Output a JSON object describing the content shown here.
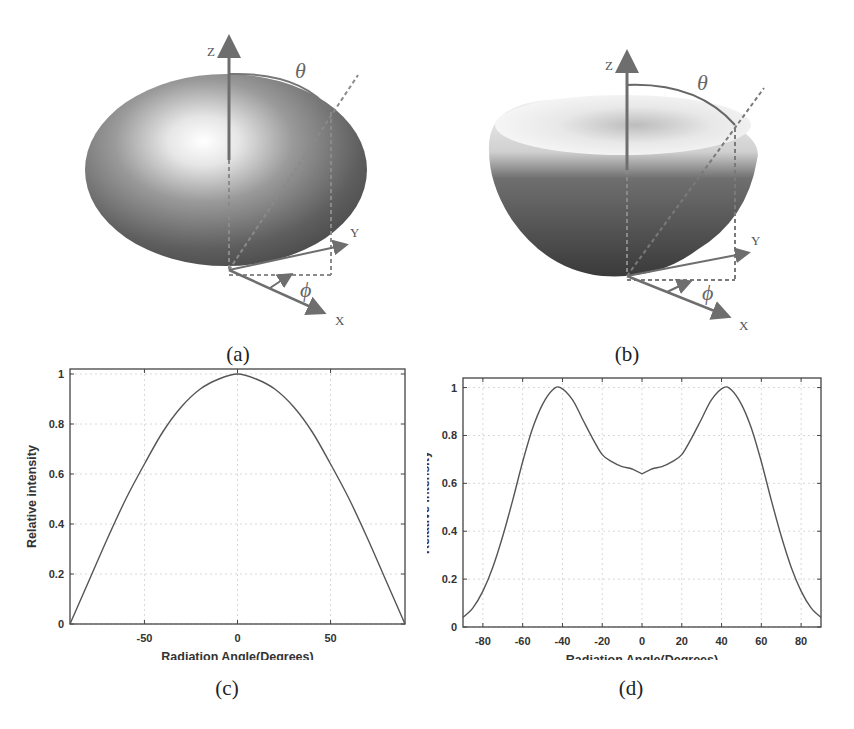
{
  "figure": {
    "panels": [
      {
        "id": "a",
        "caption": "(a)",
        "type": "3d-radiation-pattern",
        "shape": "oblate ellipsoid (Lambertian-like)",
        "axes": {
          "z": "Z",
          "y": "Y",
          "x": "X",
          "theta": "θ",
          "phi": "ϕ"
        }
      },
      {
        "id": "b",
        "caption": "(b)",
        "type": "3d-radiation-pattern",
        "shape": "bowl with central dip (batwing)",
        "axes": {
          "z": "Z",
          "y": "Y",
          "x": "X",
          "theta": "θ",
          "phi": "ϕ"
        }
      },
      {
        "id": "c",
        "caption": "(c)"
      },
      {
        "id": "d",
        "caption": "(d)"
      }
    ]
  },
  "chart_data": [
    {
      "panel": "c",
      "type": "line",
      "title": "",
      "xlabel": "Radiation Angle(Degrees)",
      "ylabel": "Relative intensity",
      "xlim": [
        -90,
        90
      ],
      "ylim": [
        0,
        1.02
      ],
      "xticks": [
        -50,
        0,
        50
      ],
      "xtick_labels": [
        "-50",
        "0",
        "50"
      ],
      "yticks": [
        0,
        0.2,
        0.4,
        0.6,
        0.8,
        1
      ],
      "ytick_labels": [
        "0",
        "0.2",
        "0.4",
        "0.6",
        "0.8",
        "1"
      ],
      "grid": true,
      "series": [
        {
          "name": "Lambertian",
          "x": [
            -90,
            -80,
            -70,
            -60,
            -50,
            -40,
            -30,
            -20,
            -10,
            0,
            10,
            20,
            30,
            40,
            50,
            60,
            70,
            80,
            90
          ],
          "values": [
            0,
            0.17,
            0.34,
            0.5,
            0.64,
            0.77,
            0.87,
            0.94,
            0.98,
            1,
            0.98,
            0.94,
            0.87,
            0.77,
            0.64,
            0.5,
            0.34,
            0.17,
            0
          ]
        }
      ]
    },
    {
      "panel": "d",
      "type": "line",
      "title": "",
      "xlabel": "Radiation Angle(Degrees)",
      "ylabel": "Relative intensity",
      "xlim": [
        -90,
        90
      ],
      "ylim": [
        0,
        1.04
      ],
      "xticks": [
        -80,
        -60,
        -40,
        -20,
        0,
        20,
        40,
        60,
        80
      ],
      "xtick_labels": [
        "-80",
        "-60",
        "-40",
        "-20",
        "0",
        "20",
        "40",
        "60",
        "80"
      ],
      "yticks": [
        0,
        0.2,
        0.4,
        0.6,
        0.8,
        1
      ],
      "ytick_labels": [
        "0",
        "0.2",
        "0.4",
        "0.6",
        "0.8",
        "1"
      ],
      "grid": true,
      "series": [
        {
          "name": "Batwing",
          "x": [
            -90,
            -85,
            -80,
            -75,
            -70,
            -65,
            -60,
            -55,
            -50,
            -45,
            -41,
            -35,
            -30,
            -25,
            -20,
            -15,
            -10,
            -5,
            0,
            5,
            10,
            15,
            20,
            25,
            30,
            35,
            41,
            45,
            50,
            55,
            60,
            65,
            70,
            75,
            80,
            85,
            90
          ],
          "values": [
            0.04,
            0.08,
            0.15,
            0.25,
            0.38,
            0.53,
            0.69,
            0.83,
            0.93,
            0.99,
            1.0,
            0.95,
            0.87,
            0.79,
            0.72,
            0.69,
            0.67,
            0.66,
            0.64,
            0.66,
            0.67,
            0.69,
            0.72,
            0.79,
            0.87,
            0.95,
            1.0,
            0.99,
            0.93,
            0.83,
            0.69,
            0.53,
            0.38,
            0.25,
            0.15,
            0.08,
            0.04
          ]
        }
      ]
    }
  ],
  "colors": {
    "curve": "#555555",
    "axis": "#444444",
    "grid": "#d8d8d8",
    "arrow": "#6e6e6e"
  }
}
